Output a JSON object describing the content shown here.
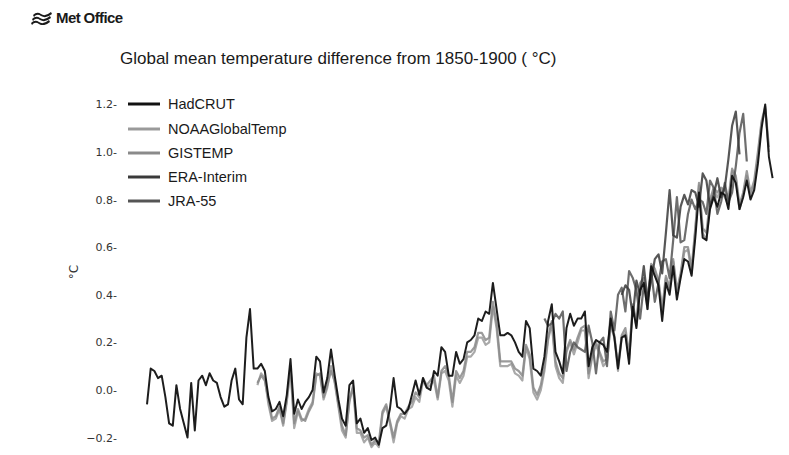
{
  "header": {
    "logo_text": "Met Office",
    "logo_icon": "met-office-waves-icon"
  },
  "colors": {
    "HadCRUT": "#111111",
    "NOAAGlobalTemp": "#9a9a9a",
    "GISTEMP": "#8a8a8a",
    "ERA-Interim": "#3a3a3a",
    "JRA-55": "#555555"
  },
  "chart_data": {
    "type": "line",
    "title": "Global mean temperature difference from 1850-1900 ( °C)",
    "xlabel": "",
    "ylabel": "°C",
    "ylim": [
      -0.25,
      1.25
    ],
    "yticks": [
      -0.2,
      0.0,
      0.2,
      0.4,
      0.6,
      0.8,
      1.0,
      1.2
    ],
    "ytick_labels": [
      "−0.2",
      "0.0",
      "0.2",
      "0.4",
      "0.6",
      "0.8",
      "1.0",
      "1.2"
    ],
    "xlim": [
      1850,
      2017
    ],
    "grid": false,
    "legend_position": "upper left",
    "legend": [
      "HadCRUT",
      "NOAAGlobalTemp",
      "GISTEMP",
      "ERA-Interim",
      "JRA-55"
    ],
    "series": [
      {
        "name": "HadCRUT",
        "start_year": 1850,
        "values": [
          -0.06,
          0.09,
          0.08,
          0.05,
          0.06,
          -0.03,
          -0.14,
          -0.15,
          0.02,
          -0.08,
          -0.14,
          -0.2,
          0.03,
          -0.17,
          0.04,
          0.06,
          0.02,
          0.07,
          0.04,
          0.03,
          -0.03,
          -0.07,
          -0.06,
          0.04,
          0.09,
          -0.04,
          -0.06,
          0.22,
          0.34,
          0.09,
          0.09,
          0.11,
          0.08,
          -0.03,
          -0.09,
          -0.08,
          -0.05,
          -0.11,
          -0.02,
          0.13,
          -0.1,
          -0.04,
          -0.08,
          -0.05,
          -0.03,
          0.0,
          0.14,
          0.12,
          -0.01,
          0.05,
          0.17,
          0.06,
          -0.04,
          -0.12,
          -0.15,
          0.02,
          0.04,
          -0.14,
          -0.12,
          -0.18,
          -0.16,
          -0.21,
          -0.2,
          -0.23,
          -0.16,
          -0.15,
          -0.08,
          0.05,
          -0.07,
          -0.08,
          -0.1,
          -0.08,
          -0.02,
          0.04,
          -0.02,
          0.05,
          0.01,
          0.0,
          0.08,
          0.06,
          0.18,
          0.16,
          0.06,
          0.06,
          0.16,
          0.11,
          0.13,
          0.2,
          0.21,
          0.23,
          0.3,
          0.29,
          0.33,
          0.32,
          0.45,
          0.34,
          0.23,
          0.23,
          0.24,
          0.23,
          0.2,
          0.16,
          0.14,
          0.29,
          0.26,
          0.09,
          0.08,
          0.06,
          0.14,
          0.29,
          0.36,
          0.16,
          0.12,
          0.07,
          0.26,
          0.32,
          0.27,
          0.3,
          0.3,
          0.33,
          0.1,
          0.18,
          0.21,
          0.2,
          0.19,
          0.16,
          0.3,
          0.22,
          0.09,
          0.22,
          0.23,
          0.11,
          0.35,
          0.26,
          0.42,
          0.45,
          0.34,
          0.52,
          0.48,
          0.44,
          0.29,
          0.45,
          0.4,
          0.52,
          0.38,
          0.47,
          0.55,
          0.54,
          0.48,
          0.64,
          0.83,
          0.64,
          0.63,
          0.76,
          0.81,
          0.77,
          0.83,
          0.82,
          0.76,
          0.9,
          0.87,
          0.76,
          0.81,
          0.88,
          0.8,
          0.84,
          0.95,
          1.1,
          1.2,
          0.98,
          0.89
        ]
      },
      {
        "name": "NOAAGlobalTemp",
        "start_year": 1880,
        "values": [
          0.02,
          0.07,
          0.05,
          -0.06,
          -0.13,
          -0.12,
          -0.08,
          -0.15,
          -0.05,
          0.09,
          -0.16,
          -0.09,
          -0.13,
          -0.12,
          -0.08,
          -0.05,
          0.07,
          0.06,
          -0.04,
          0.01,
          0.1,
          0.03,
          -0.07,
          -0.17,
          -0.2,
          -0.04,
          0.01,
          -0.18,
          -0.18,
          -0.22,
          -0.2,
          -0.24,
          -0.22,
          -0.24,
          -0.1,
          -0.07,
          -0.14,
          -0.22,
          -0.14,
          -0.11,
          -0.12,
          -0.08,
          -0.07,
          -0.03,
          -0.05,
          0.04,
          0.01,
          0.02,
          0.04,
          -0.04,
          0.07,
          0.08,
          0.04,
          -0.07,
          0.06,
          0.03,
          0.06,
          0.14,
          0.14,
          0.16,
          0.22,
          0.22,
          0.19,
          0.2,
          0.35,
          0.26,
          0.1,
          0.1,
          0.1,
          0.11,
          0.07,
          0.06,
          0.04,
          0.18,
          0.13,
          -0.01,
          -0.04,
          0.0,
          0.08,
          0.21,
          0.28,
          0.1,
          0.05,
          0.03,
          0.16,
          0.2,
          0.15,
          0.2,
          0.25,
          0.25,
          0.05,
          0.14,
          0.19,
          0.15,
          0.1,
          0.12,
          0.27,
          0.22,
          0.08,
          0.22,
          0.24,
          0.13,
          0.35,
          0.27,
          0.44,
          0.47,
          0.34,
          0.52,
          0.5,
          0.45,
          0.32,
          0.47,
          0.42,
          0.54,
          0.4,
          0.48,
          0.58,
          0.59,
          0.49,
          0.67,
          0.86,
          0.66,
          0.63,
          0.78,
          0.84,
          0.81,
          0.84,
          0.81,
          0.78,
          0.92,
          0.89,
          0.76,
          0.82,
          0.9,
          0.81,
          0.86,
          0.98,
          1.12,
          1.18,
          1.0
        ]
      },
      {
        "name": "GISTEMP",
        "start_year": 1880,
        "values": [
          0.03,
          0.06,
          0.04,
          -0.04,
          -0.12,
          -0.11,
          -0.07,
          -0.14,
          -0.04,
          0.1,
          -0.14,
          -0.08,
          -0.12,
          -0.13,
          -0.09,
          -0.06,
          0.06,
          0.07,
          -0.03,
          0.02,
          0.08,
          0.04,
          -0.06,
          -0.15,
          -0.19,
          -0.05,
          0.02,
          -0.16,
          -0.17,
          -0.2,
          -0.19,
          -0.23,
          -0.21,
          -0.22,
          -0.09,
          -0.06,
          -0.13,
          -0.2,
          -0.13,
          -0.1,
          -0.1,
          -0.07,
          -0.05,
          -0.01,
          -0.03,
          0.05,
          0.02,
          0.04,
          0.06,
          -0.03,
          0.08,
          0.1,
          0.06,
          -0.05,
          0.08,
          0.05,
          0.08,
          0.16,
          0.16,
          0.18,
          0.24,
          0.24,
          0.21,
          0.22,
          0.37,
          0.28,
          0.12,
          0.12,
          0.12,
          0.12,
          0.09,
          0.08,
          0.06,
          0.19,
          0.15,
          0.01,
          -0.02,
          0.02,
          0.1,
          0.22,
          0.29,
          0.12,
          0.07,
          0.05,
          0.17,
          0.21,
          0.17,
          0.22,
          0.26,
          0.27,
          0.07,
          0.15,
          0.2,
          0.16,
          0.12,
          0.13,
          0.28,
          0.23,
          0.1,
          0.23,
          0.26,
          0.15,
          0.36,
          0.29,
          0.45,
          0.47,
          0.36,
          0.53,
          0.51,
          0.46,
          0.34,
          0.48,
          0.43,
          0.55,
          0.42,
          0.49,
          0.6,
          0.6,
          0.51,
          0.68,
          0.87,
          0.68,
          0.66,
          0.8,
          0.85,
          0.83,
          0.85,
          0.84,
          0.8,
          0.93,
          0.9,
          0.78,
          0.83,
          0.92,
          0.83,
          0.88,
          1.0,
          1.13,
          1.19,
          1.02
        ]
      },
      {
        "name": "JRA-55",
        "start_year": 1958,
        "values": [
          0.3,
          0.27,
          0.28,
          0.32,
          0.3,
          0.33,
          0.08,
          0.16,
          0.2,
          0.18,
          0.17,
          0.16,
          0.27,
          0.2,
          0.07,
          0.2,
          0.22,
          0.1,
          0.33,
          0.25,
          0.4,
          0.43,
          0.33,
          0.5,
          0.47,
          0.42,
          0.3,
          0.44,
          0.39,
          0.5,
          0.37,
          0.45,
          0.54,
          0.55,
          0.47,
          0.63,
          0.81,
          0.62,
          0.63,
          0.74,
          0.8,
          0.76,
          0.8,
          0.79,
          0.74,
          0.88,
          0.85,
          0.74,
          0.79,
          0.87,
          0.79,
          0.83,
          0.94,
          1.08,
          1.16,
          0.96
        ]
      },
      {
        "name": "ERA-Interim",
        "start_year": 1979,
        "values": [
          0.4,
          0.44,
          0.42,
          0.31,
          0.46,
          0.4,
          0.52,
          0.38,
          0.46,
          0.55,
          0.57,
          0.49,
          0.66,
          0.84,
          0.65,
          0.64,
          0.77,
          0.82,
          0.78,
          0.84,
          0.83,
          0.77,
          0.91,
          0.88,
          0.77,
          0.82,
          0.89,
          0.81,
          0.85,
          0.97,
          1.11,
          1.17,
          0.99
        ]
      }
    ]
  }
}
